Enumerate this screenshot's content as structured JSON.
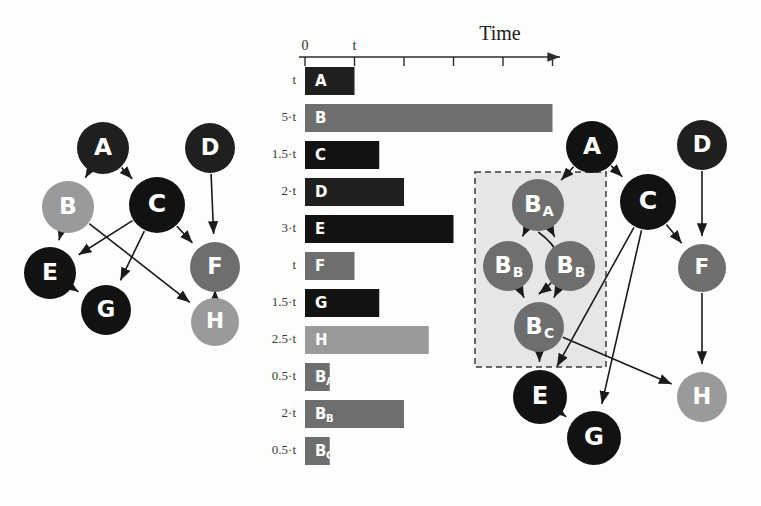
{
  "figure": {
    "background_color": "#fdfdfc",
    "panels": [
      "task-dag",
      "gantt-timeline",
      "expanded-dag"
    ]
  },
  "palette": {
    "black": "#121212",
    "dark": "#1f1f1f",
    "mid_gray": "#6e6e6e",
    "light_gray": "#9a9a9a",
    "box_fill": "#e0e0e0",
    "box_border": "#3a3a3a",
    "edge": "#1a1a1a",
    "axis": "#2b2b2b",
    "label_text": "#3a3a3a"
  },
  "left_graph": {
    "title": "",
    "nodes": [
      {
        "id": "A",
        "label": "A",
        "x": 103,
        "y": 148,
        "r": 26,
        "color": "#1f1f1f"
      },
      {
        "id": "B",
        "label": "B",
        "x": 68,
        "y": 207,
        "r": 26,
        "color": "#9a9a9a"
      },
      {
        "id": "C",
        "label": "C",
        "x": 157,
        "y": 205,
        "r": 28,
        "color": "#121212"
      },
      {
        "id": "D",
        "label": "D",
        "x": 210,
        "y": 148,
        "r": 25,
        "color": "#1f1f1f"
      },
      {
        "id": "E",
        "label": "E",
        "x": 50,
        "y": 273,
        "r": 26,
        "color": "#121212"
      },
      {
        "id": "F",
        "label": "F",
        "x": 215,
        "y": 267,
        "r": 25,
        "color": "#6e6e6e"
      },
      {
        "id": "G",
        "label": "G",
        "x": 106,
        "y": 310,
        "r": 25,
        "color": "#121212"
      },
      {
        "id": "H",
        "label": "H",
        "x": 215,
        "y": 322,
        "r": 24,
        "color": "#9a9a9a"
      }
    ],
    "edges": [
      {
        "from": "A",
        "to": "B"
      },
      {
        "from": "A",
        "to": "C"
      },
      {
        "from": "B",
        "to": "E"
      },
      {
        "from": "B",
        "to": "H"
      },
      {
        "from": "C",
        "to": "E"
      },
      {
        "from": "C",
        "to": "F"
      },
      {
        "from": "C",
        "to": "G"
      },
      {
        "from": "D",
        "to": "F"
      },
      {
        "from": "E",
        "to": "G"
      },
      {
        "from": "F",
        "to": "H"
      }
    ]
  },
  "right_graph": {
    "dashed_box": {
      "x": 475,
      "y": 172,
      "width": 131,
      "height": 195,
      "fill": "#e6e6e6",
      "stroke": "#3a3a3a"
    },
    "nodes": [
      {
        "id": "A",
        "label": "A",
        "sub": "",
        "x": 592,
        "y": 147,
        "r": 26,
        "color": "#121212"
      },
      {
        "id": "D",
        "label": "D",
        "sub": "",
        "x": 702,
        "y": 145,
        "r": 25,
        "color": "#1f1f1f"
      },
      {
        "id": "C",
        "label": "C",
        "sub": "",
        "x": 648,
        "y": 202,
        "r": 28,
        "color": "#121212"
      },
      {
        "id": "BA",
        "label": "B",
        "sub": "A",
        "x": 538,
        "y": 205,
        "r": 26,
        "color": "#6e6e6e"
      },
      {
        "id": "BB1",
        "label": "B",
        "sub": "B",
        "x": 508,
        "y": 266,
        "r": 25,
        "color": "#6e6e6e"
      },
      {
        "id": "BB2",
        "label": "B",
        "sub": "B",
        "x": 570,
        "y": 266,
        "r": 25,
        "color": "#6e6e6e"
      },
      {
        "id": "BC",
        "label": "B",
        "sub": "C",
        "x": 539,
        "y": 327,
        "r": 25,
        "color": "#6e6e6e"
      },
      {
        "id": "F",
        "label": "F",
        "sub": "",
        "x": 702,
        "y": 268,
        "r": 24,
        "color": "#6e6e6e"
      },
      {
        "id": "E",
        "label": "E",
        "sub": "",
        "x": 540,
        "y": 397,
        "r": 27,
        "color": "#121212"
      },
      {
        "id": "G",
        "label": "G",
        "sub": "",
        "x": 594,
        "y": 438,
        "r": 27,
        "color": "#121212"
      },
      {
        "id": "H",
        "label": "H",
        "sub": "",
        "x": 702,
        "y": 397,
        "r": 25,
        "color": "#9a9a9a"
      }
    ],
    "edges": [
      {
        "from": "A",
        "to": "BA"
      },
      {
        "from": "A",
        "to": "C"
      },
      {
        "from": "BA",
        "to": "BB1"
      },
      {
        "from": "BA",
        "to": "BB2"
      },
      {
        "from": "BA",
        "to": "BC",
        "curved": true
      },
      {
        "from": "BB1",
        "to": "BC"
      },
      {
        "from": "BB2",
        "to": "BC"
      },
      {
        "from": "BC",
        "to": "E"
      },
      {
        "from": "BC",
        "to": "H"
      },
      {
        "from": "C",
        "to": "E"
      },
      {
        "from": "C",
        "to": "G"
      },
      {
        "from": "C",
        "to": "F"
      },
      {
        "from": "D",
        "to": "F"
      },
      {
        "from": "E",
        "to": "G"
      },
      {
        "from": "F",
        "to": "H"
      }
    ]
  },
  "chart_data": {
    "type": "bar",
    "orientation": "horizontal",
    "title": "",
    "xlabel": "Time",
    "ylabel": "",
    "axis_title": "Time",
    "tick_labels": [
      "0",
      "t",
      "",
      "",
      "",
      ""
    ],
    "tick_values": [
      0,
      1,
      2,
      3,
      4,
      5
    ],
    "unit_px": 49.5,
    "xlim": [
      0,
      5.2
    ],
    "grid": false,
    "legend": null,
    "categories": [
      "A",
      "B",
      "C",
      "D",
      "E",
      "F",
      "G",
      "H",
      "B_A",
      "B_B",
      "B_C"
    ],
    "values": [
      1,
      5,
      1.5,
      2,
      3,
      1,
      1.5,
      2.5,
      0.5,
      2,
      0.5
    ],
    "duration_labels": [
      "t",
      "5·t",
      "1.5·t",
      "2·t",
      "3·t",
      "t",
      "1.5·t",
      "2.5·t",
      "0.5·t",
      "2·t",
      "0.5·t"
    ],
    "bars": [
      {
        "label": "A",
        "sub": "",
        "duration_label": "t",
        "value": 1,
        "color": "#1f1f1f"
      },
      {
        "label": "B",
        "sub": "",
        "duration_label": "5·t",
        "value": 5,
        "color": "#6e6e6e"
      },
      {
        "label": "C",
        "sub": "",
        "duration_label": "1.5·t",
        "value": 1.5,
        "color": "#121212"
      },
      {
        "label": "D",
        "sub": "",
        "duration_label": "2·t",
        "value": 2,
        "color": "#1f1f1f"
      },
      {
        "label": "E",
        "sub": "",
        "duration_label": "3·t",
        "value": 3,
        "color": "#121212"
      },
      {
        "label": "F",
        "sub": "",
        "duration_label": "t",
        "value": 1,
        "color": "#6e6e6e"
      },
      {
        "label": "G",
        "sub": "",
        "duration_label": "1.5·t",
        "value": 1.5,
        "color": "#121212"
      },
      {
        "label": "H",
        "sub": "",
        "duration_label": "2.5·t",
        "value": 2.5,
        "color": "#9a9a9a"
      },
      {
        "label": "B",
        "sub": "A",
        "duration_label": "0.5·t",
        "value": 0.5,
        "color": "#6e6e6e"
      },
      {
        "label": "B",
        "sub": "B",
        "duration_label": "2·t",
        "value": 2,
        "color": "#6e6e6e"
      },
      {
        "label": "B",
        "sub": "C",
        "duration_label": "0.5·t",
        "value": 0.5,
        "color": "#6e6e6e"
      }
    ]
  }
}
